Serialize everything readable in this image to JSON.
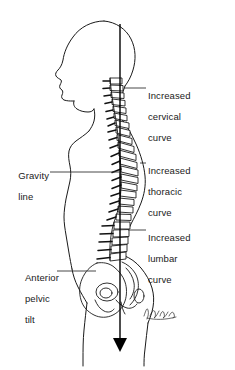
{
  "figure": {
    "background_color": "#ffffff",
    "ink_color": "#1a1a1a"
  },
  "labels": {
    "cervical": {
      "lines": [
        "Increased",
        "cervical",
        "curve"
      ],
      "full_text": "Increased cervical curve",
      "position": "right"
    },
    "thoracic": {
      "lines": [
        "Increased",
        "thoracic",
        "curve"
      ],
      "full_text": "Increased thoracic curve",
      "position": "right"
    },
    "lumbar": {
      "lines": [
        "Increased",
        "lumbar",
        "curve"
      ],
      "full_text": "Increased lumbar curve",
      "position": "right"
    },
    "gravity": {
      "lines": [
        "Gravity",
        "line"
      ],
      "full_text": "Gravity line",
      "position": "left"
    },
    "pelvic": {
      "lines": [
        "Anterior",
        "pelvic",
        "tilt"
      ],
      "full_text": "Anterior pelvic tilt",
      "position": "left"
    }
  },
  "elements": {
    "gravity_line_name": "gravity-line",
    "arrow_direction": "down",
    "signature": "artist-signature"
  }
}
